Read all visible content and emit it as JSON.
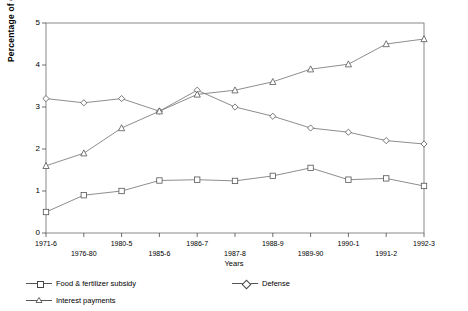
{
  "chart_data": {
    "type": "line",
    "title": "",
    "xlabel": "Years",
    "ylabel": "Percentage of GDP",
    "ylim": [
      0,
      5
    ],
    "yticks": [
      0,
      1,
      2,
      3,
      4,
      5
    ],
    "grid": false,
    "legend_position": "bottom",
    "categories": [
      "1971-6",
      "1976-80",
      "1980-5",
      "1985-6",
      "1986-7",
      "1987-8",
      "1988-9",
      "1989-90",
      "1990-1",
      "1991-2",
      "1992-3"
    ],
    "series": [
      {
        "name": "Food & fertilizer subsidy",
        "marker": "square",
        "values": [
          0.5,
          0.9,
          1.0,
          1.25,
          1.27,
          1.24,
          1.36,
          1.55,
          1.27,
          1.3,
          1.12
        ]
      },
      {
        "name": "Defense",
        "marker": "diamond",
        "values": [
          3.2,
          3.1,
          3.2,
          2.9,
          3.4,
          3.0,
          2.78,
          2.5,
          2.4,
          2.2,
          2.12
        ]
      },
      {
        "name": "Interest payments",
        "marker": "triangle",
        "values": [
          1.6,
          1.9,
          2.5,
          2.9,
          3.3,
          3.4,
          3.6,
          3.9,
          4.02,
          4.5,
          4.62
        ]
      }
    ]
  },
  "legend": {
    "items": [
      {
        "label": "Food & fertilizer subsidy",
        "marker": "square"
      },
      {
        "label": "Defense",
        "marker": "diamond"
      },
      {
        "label": "Interest payments",
        "marker": "triangle"
      }
    ]
  }
}
